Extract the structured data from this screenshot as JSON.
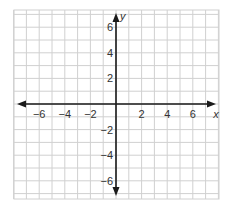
{
  "chart_data": {
    "type": "scatter",
    "title": "",
    "xlabel": "x",
    "ylabel": "y",
    "xlim": [
      -8,
      8
    ],
    "ylim": [
      -7.4,
      7.4
    ],
    "grid": true,
    "grid_step": 1,
    "x_ticks": [
      -6,
      -4,
      -2,
      2,
      4,
      6
    ],
    "x_tick_labels": [
      "−6",
      "−4",
      "−2",
      "2",
      "4",
      "6"
    ],
    "y_ticks": [
      6,
      4,
      2,
      -2,
      -4,
      -6
    ],
    "y_tick_labels": [
      "6",
      "4",
      "2",
      "−2",
      "−4",
      "−6"
    ],
    "series": [],
    "legend": null,
    "colors": {
      "grid": "#d0d0d0",
      "axis": "#1a1a1a",
      "text": "#333333"
    }
  },
  "layout": {
    "origin_px": [
      116,
      104
    ],
    "unit_px": 12.8,
    "grid_bounds_px": {
      "left": 14,
      "right": 219,
      "top": 10,
      "bottom": 199
    }
  }
}
